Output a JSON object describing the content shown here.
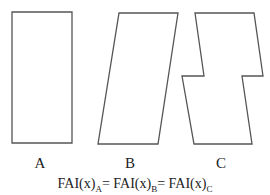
{
  "shapes": [
    {
      "id": "A",
      "label": "A",
      "type": "rectangle",
      "points": [
        [
          12,
          12
        ],
        [
          72,
          12
        ],
        [
          72,
          143
        ],
        [
          12,
          143
        ]
      ]
    },
    {
      "id": "B",
      "label": "B",
      "type": "parallelogram",
      "points": [
        [
          119,
          13
        ],
        [
          178,
          13
        ],
        [
          158,
          144
        ],
        [
          98,
          144
        ]
      ]
    },
    {
      "id": "C",
      "label": "C",
      "type": "stepped-parallelogram",
      "points": [
        [
          195,
          13
        ],
        [
          254,
          13
        ],
        [
          263,
          76
        ],
        [
          242,
          76
        ],
        [
          252,
          144
        ],
        [
          194,
          144
        ],
        [
          182,
          76
        ],
        [
          204,
          76
        ]
      ]
    }
  ],
  "equation": {
    "term_a": "FAI(x)",
    "sub_a": "A",
    "eq1": "= ",
    "term_b": "FAI(x)",
    "sub_b": "B",
    "eq2": "= ",
    "term_c": "FAI(x)",
    "sub_c": "C"
  },
  "stroke_color": "#555555"
}
